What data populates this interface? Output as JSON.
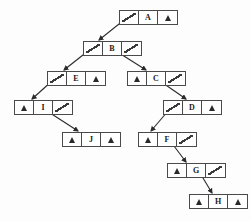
{
  "diagram": {
    "null_symbol": "∧",
    "pointer_symbol": "/",
    "colors": {
      "background": "#fdfdfd",
      "border": "#4a4a4a",
      "text": "#1a1a1a",
      "edge": "#2a2a2a"
    },
    "nodes": [
      {
        "id": "A",
        "key": "A",
        "left": "ptr-down",
        "right": "nil",
        "x": 119,
        "y": 10
      },
      {
        "id": "B",
        "key": "B",
        "left": "ptr-down",
        "right": "ptr-down",
        "x": 83,
        "y": 41
      },
      {
        "id": "E",
        "key": "E",
        "left": "ptr-down",
        "right": "nil",
        "x": 47,
        "y": 71
      },
      {
        "id": "C",
        "key": "C",
        "left": "nil",
        "right": "ptr-down",
        "x": 127,
        "y": 71
      },
      {
        "id": "I",
        "key": "I",
        "left": "nil",
        "right": "ptr-down",
        "x": 14,
        "y": 100
      },
      {
        "id": "D",
        "key": "D",
        "left": "ptr-down",
        "right": "nil",
        "x": 163,
        "y": 100
      },
      {
        "id": "J",
        "key": "J",
        "left": "nil",
        "right": "nil",
        "x": 62,
        "y": 132
      },
      {
        "id": "F",
        "key": "F",
        "left": "nil",
        "right": "ptr-down",
        "x": 138,
        "y": 132
      },
      {
        "id": "G",
        "key": "G",
        "left": "nil",
        "right": "ptr-down",
        "x": 167,
        "y": 163
      },
      {
        "id": "H",
        "key": "H",
        "left": "nil",
        "right": "nil",
        "x": 189,
        "y": 194
      }
    ],
    "edges": [
      {
        "from": "A",
        "to": "B",
        "side": "left",
        "x1": 124,
        "y1": 20,
        "x2": 99,
        "y2": 40
      },
      {
        "from": "B",
        "to": "E",
        "side": "left",
        "x1": 88,
        "y1": 51,
        "x2": 64,
        "y2": 70
      },
      {
        "from": "B",
        "to": "C",
        "side": "right",
        "x1": 116,
        "y1": 51,
        "x2": 146,
        "y2": 70
      },
      {
        "from": "E",
        "to": "I",
        "side": "left",
        "x1": 52,
        "y1": 81,
        "x2": 32,
        "y2": 99
      },
      {
        "from": "C",
        "to": "D",
        "side": "right",
        "x1": 160,
        "y1": 81,
        "x2": 186,
        "y2": 99
      },
      {
        "from": "I",
        "to": "J",
        "side": "right",
        "x1": 47,
        "y1": 111,
        "x2": 78,
        "y2": 131
      },
      {
        "from": "D",
        "to": "F",
        "side": "left",
        "x1": 168,
        "y1": 111,
        "x2": 151,
        "y2": 131
      },
      {
        "from": "F",
        "to": "G",
        "side": "right",
        "x1": 171,
        "y1": 142,
        "x2": 186,
        "y2": 162
      },
      {
        "from": "G",
        "to": "H",
        "side": "right",
        "x1": 200,
        "y1": 173,
        "x2": 212,
        "y2": 193
      }
    ]
  }
}
